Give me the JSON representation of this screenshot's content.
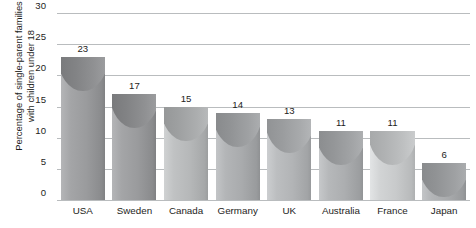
{
  "chart_data": {
    "type": "bar",
    "title": "",
    "subtitle": "",
    "xlabel": "",
    "ylabel": "Percentage of single-parent families with children under 18",
    "ylabel_lines": [
      "Percentage of single-parent families",
      "with children under 18"
    ],
    "categories": [
      "USA",
      "Sweden",
      "Canada",
      "Germany",
      "UK",
      "Australia",
      "France",
      "Japan"
    ],
    "values": [
      23,
      17,
      15,
      14,
      13,
      11,
      11,
      6
    ],
    "value_labels": [
      "23",
      "17",
      "15",
      "14",
      "13",
      "11",
      "11",
      "6"
    ],
    "ylim": [
      0,
      30
    ],
    "ytick_values": [
      30,
      25,
      20,
      15,
      10,
      5,
      0
    ],
    "ytick_labels": [
      "30",
      "25",
      "20",
      "15",
      "10",
      "5",
      "0"
    ],
    "grid": true,
    "grid_orientation": "horizontal",
    "legend": false,
    "legend_position": "none",
    "bar_colors": [
      "#9a9b9d",
      "#9a9b9d",
      "#b6b8b9",
      "#a9abad",
      "#b2b4b6",
      "#acaeb0",
      "#c8cacb",
      "#a9abad"
    ],
    "grid_color": "#b9bcbe",
    "text_color": "#1d1d1b",
    "background_color": "#ffffff"
  }
}
